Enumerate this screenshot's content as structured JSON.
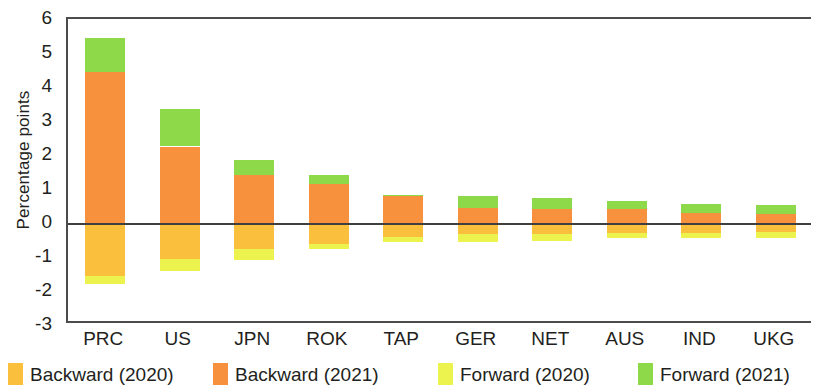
{
  "chart_data": {
    "type": "bar",
    "title": "",
    "subtitle": "",
    "xlabel": "",
    "ylabel": "Percentage points",
    "stacked": true,
    "grid": false,
    "legend_position": "bottom",
    "ylim": [
      -3,
      6
    ],
    "yticks": [
      6,
      5,
      4,
      3,
      2,
      1,
      0,
      -1,
      -2,
      -3
    ],
    "ytick_labels": [
      "6",
      "5",
      "4",
      "3",
      "2",
      "1",
      "0",
      "-1",
      "-2",
      "-3"
    ],
    "categories": [
      "PRC",
      "US",
      "JPN",
      "ROK",
      "TAP",
      "GER",
      "NET",
      "AUS",
      "IND",
      "UKG"
    ],
    "series": [
      {
        "name": "Backward (2020)",
        "color": "#fbbf3e",
        "values": [
          -1.55,
          -1.05,
          -0.75,
          -0.62,
          -0.42,
          -0.32,
          -0.32,
          -0.3,
          -0.28,
          -0.26
        ]
      },
      {
        "name": "Backward (2021)",
        "color": "#f7913d",
        "values": [
          4.45,
          2.25,
          1.4,
          1.15,
          0.8,
          0.45,
          0.42,
          0.42,
          0.28,
          0.26
        ]
      },
      {
        "name": "Forward (2020)",
        "color": "#edf34e",
        "values": [
          -0.25,
          -0.35,
          -0.33,
          -0.15,
          -0.15,
          -0.23,
          -0.2,
          -0.15,
          -0.15,
          -0.17
        ]
      },
      {
        "name": "Forward (2021)",
        "color": "#8dd94a",
        "values": [
          1.0,
          1.1,
          0.45,
          0.25,
          0.02,
          0.35,
          0.33,
          0.22,
          0.27,
          0.28
        ]
      }
    ]
  }
}
